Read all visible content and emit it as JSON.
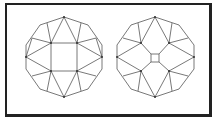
{
  "figure": {
    "left_diagram": {
      "name": "octagon-with-square-table"
    },
    "right_diagram": {
      "name": "octagon-with-small-square-center"
    },
    "colors": {
      "line": "#555555",
      "frame": "#222222",
      "background": "#ffffff"
    }
  }
}
